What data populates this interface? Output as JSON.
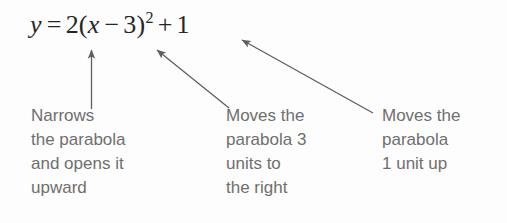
{
  "figure": {
    "type": "annotated-equation-diagram",
    "background_color": "#fdfdfd",
    "equation_color": "#262626",
    "caption_color": "#6f6f6f",
    "arrow_color": "#5e5e5e"
  },
  "equation": {
    "full_text": "y = 2(x − 3)² + 1",
    "lhs": "y",
    "equals": "=",
    "coefficient": "2",
    "open_paren": "(",
    "variable": "x",
    "minus": "−",
    "shift": "3",
    "close_paren": ")",
    "exponent": "2",
    "plus": "+",
    "constant": "1"
  },
  "annotations": [
    {
      "id": "narrows",
      "target": "coefficient 2",
      "arrow": "vertical-up-arrow",
      "lines": [
        "Narrows",
        "the parabola",
        "and opens it",
        "upward"
      ]
    },
    {
      "id": "moves-right",
      "target": "minus 3",
      "arrow": "diagonal-up-left-arrow",
      "lines": [
        "Moves the",
        "parabola 3",
        "units to",
        "the right"
      ]
    },
    {
      "id": "moves-up",
      "target": "plus 1",
      "arrow": "diagonal-up-left-arrow",
      "lines": [
        "Moves the",
        "parabola",
        "1 unit up"
      ]
    }
  ]
}
